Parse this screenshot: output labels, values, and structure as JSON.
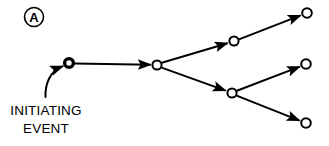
{
  "figure": {
    "panel_label": "A",
    "caption_line_1": "INITIATING",
    "caption_line_2": "EVENT",
    "stroke_color": "#000000",
    "node_fill_color": "#ffffff",
    "background_color": "#ffffff"
  },
  "diagram": {
    "type": "event-tree",
    "nodes": [
      {
        "id": "initiating",
        "label": "initiating-event-node",
        "x": 69,
        "y": 63,
        "r": 5.2,
        "style": "heavy-ring"
      },
      {
        "id": "branch-1",
        "label": "first-branch-node",
        "x": 157,
        "y": 65,
        "r": 5.0,
        "style": "ring"
      },
      {
        "id": "branch-upper",
        "label": "upper-branch-node",
        "x": 234,
        "y": 41,
        "r": 5.0,
        "style": "ring"
      },
      {
        "id": "branch-lower",
        "label": "lower-branch-node",
        "x": 232,
        "y": 93,
        "r": 5.0,
        "style": "ring"
      },
      {
        "id": "outcome-top",
        "label": "top-outcome-node",
        "x": 307,
        "y": 13,
        "r": 5.0,
        "style": "ring"
      },
      {
        "id": "outcome-middle",
        "label": "middle-outcome-node",
        "x": 306,
        "y": 64,
        "r": 5.0,
        "style": "ring"
      },
      {
        "id": "outcome-bottom",
        "label": "bottom-outcome-node",
        "x": 306,
        "y": 123,
        "r": 5.0,
        "style": "ring"
      }
    ],
    "edges": [
      {
        "id": "edge-initiating-inflow",
        "from": "caption",
        "to": "initiating",
        "shape": "curved",
        "arrow": true
      },
      {
        "id": "edge-initiating-branch1",
        "from": "initiating",
        "to": "branch-1",
        "shape": "straight",
        "arrow": true
      },
      {
        "id": "edge-branch1-upper",
        "from": "branch-1",
        "to": "branch-upper",
        "shape": "straight",
        "arrow": true
      },
      {
        "id": "edge-branch1-lower",
        "from": "branch-1",
        "to": "branch-lower",
        "shape": "straight",
        "arrow": true
      },
      {
        "id": "edge-upper-top",
        "from": "branch-upper",
        "to": "outcome-top",
        "shape": "straight",
        "arrow": true
      },
      {
        "id": "edge-lower-middle",
        "from": "branch-lower",
        "to": "outcome-middle",
        "shape": "straight",
        "arrow": true
      },
      {
        "id": "edge-lower-bottom",
        "from": "branch-lower",
        "to": "outcome-bottom",
        "shape": "straight",
        "arrow": true
      }
    ],
    "panel_badge": {
      "cx": 34,
      "cy": 17,
      "r": 9.5
    }
  }
}
